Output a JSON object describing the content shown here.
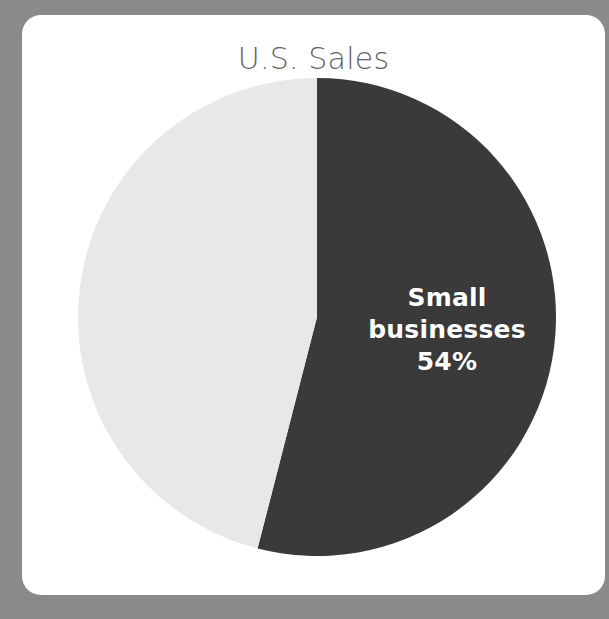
{
  "theme": {
    "page_background": "#8a8a8a",
    "card_background": "#ffffff",
    "title_color": "#636363",
    "label_color": "#ffffff"
  },
  "card": {
    "title": "U.S. Sales"
  },
  "chart_data": {
    "type": "pie",
    "title": "U.S. Sales",
    "subtitle": "",
    "xlabel": "",
    "ylabel": "",
    "legend": "none",
    "grid": false,
    "start_angle_deg": 0,
    "direction": "clockwise",
    "categories": [
      "Small businesses",
      "Other"
    ],
    "values": [
      54,
      46
    ],
    "units": "percent",
    "colors": [
      "#3a3a3a",
      "#e8e8e8"
    ],
    "slices": [
      {
        "name": "Small businesses",
        "value": 54,
        "value_label": "54%",
        "color": "#3a3a3a",
        "label_lines": [
          "Small",
          "businesses",
          "54%"
        ],
        "label_visible": true,
        "label_color": "#ffffff"
      },
      {
        "name": "Other",
        "value": 46,
        "value_label": "",
        "color": "#e8e8e8",
        "label_lines": [],
        "label_visible": false,
        "label_color": "#3a3a3a"
      }
    ],
    "annotations": []
  },
  "slice_label": {
    "line1": "Small",
    "line2": "businesses",
    "line3": "54%"
  }
}
